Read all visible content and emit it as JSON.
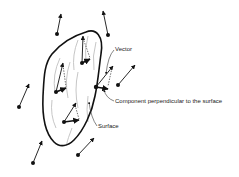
{
  "diagram": {
    "labels": {
      "vector": "Vector",
      "component": "Component perpendicular to the surface",
      "surface": "Surface"
    },
    "colors": {
      "ink": "#111111",
      "hatch": "#b0b0b0",
      "dashed": "#333333",
      "background": "#ffffff"
    },
    "external_vectors": [
      {
        "from": [
          57,
          34
        ],
        "to": [
          61,
          14
        ]
      },
      {
        "from": [
          108,
          35
        ],
        "to": [
          103,
          11
        ]
      },
      {
        "from": [
          118,
          85
        ],
        "to": [
          135,
          65
        ]
      },
      {
        "from": [
          19,
          107
        ],
        "to": [
          29,
          84
        ]
      },
      {
        "from": [
          33,
          163
        ],
        "to": [
          42,
          141
        ]
      },
      {
        "from": [
          78,
          155
        ],
        "to": [
          94,
          138
        ]
      }
    ],
    "surface_vectors": [
      {
        "point": [
          82,
          63
        ],
        "vector_tip": [
          83,
          36
        ],
        "component_tip": [
          90,
          59
        ]
      },
      {
        "point": [
          56,
          92
        ],
        "vector_tip": [
          63,
          63
        ],
        "component_tip": [
          66,
          88
        ]
      },
      {
        "point": [
          64,
          122
        ],
        "vector_tip": [
          76,
          103
        ],
        "component_tip": [
          79,
          120
        ]
      },
      {
        "point": [
          96,
          87
        ],
        "vector_tip": [
          113,
          66
        ],
        "component_tip": [
          108,
          89
        ]
      }
    ]
  }
}
